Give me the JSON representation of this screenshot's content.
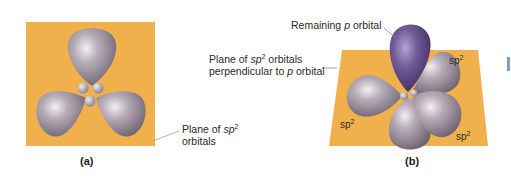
{
  "figure_a": {
    "caption": "(a)",
    "label": {
      "prefix": "Plane of ",
      "italic": "sp",
      "sup": "2",
      "line2": "orbitals"
    }
  },
  "figure_b": {
    "caption": "(b)",
    "p_orbital_label": {
      "prefix": "Remaining ",
      "italic": "p",
      "suffix": " orbital"
    },
    "plane_label": {
      "line1_prefix": "Plane of ",
      "line1_italic": "sp",
      "line1_sup": "2",
      "line1_suffix": " orbitals",
      "line2_prefix": "perpendicular to ",
      "line2_italic": "p",
      "line2_suffix": " orbital"
    },
    "hybrid_labels": [
      {
        "base": "sp",
        "sup": "2",
        "position": "upper-right"
      },
      {
        "base": "sp",
        "sup": "2",
        "position": "lower-left"
      },
      {
        "base": "sp",
        "sup": "2",
        "position": "lower-right"
      }
    ]
  },
  "colors": {
    "plane": "#f1b14b",
    "orbital_gray": "#9c8f9c",
    "p_orbital_purple": "#6b558f",
    "leader_line": "#8a8a8a"
  }
}
